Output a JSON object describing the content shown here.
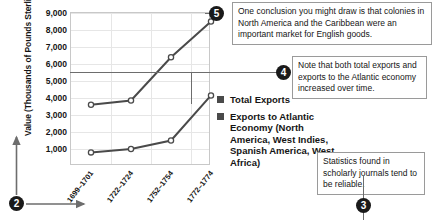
{
  "chart_data": {
    "type": "line",
    "title": "",
    "xlabel": "",
    "ylabel": "Value (Thousands of Pounds Sterling)",
    "categories": [
      "1699–1701",
      "1722–1724",
      "1752–1754",
      "1772–1774"
    ],
    "yticks": [
      "1,000",
      "2,000",
      "3,000",
      "4,000",
      "5,000",
      "6,000",
      "7,000",
      "8,000",
      "9,000"
    ],
    "ylim": [
      0,
      9000
    ],
    "ytick_values": [
      1000,
      2000,
      3000,
      4000,
      5000,
      6000,
      7000,
      8000,
      9000
    ],
    "grid": true,
    "legend_position": "right",
    "series": [
      {
        "name": "Total Exports",
        "color": "#4a4a4a",
        "values": [
          3600,
          3850,
          6400,
          8500
        ]
      },
      {
        "name": "Exports to Atlantic Economy (North America, West Indies, Spanish America, West Africa)",
        "color": "#4a4a4a",
        "values": [
          800,
          1000,
          1500,
          4150
        ]
      }
    ]
  },
  "legend": {
    "items": [
      {
        "label": "Total Exports",
        "swatch": "#4a4a4a"
      },
      {
        "label": "Exports to Atlantic Economy (North America, West Indies, Spanish America, West Africa)",
        "swatch": "#4a4a4a"
      }
    ]
  },
  "callouts": [
    {
      "number": "5",
      "text": "One conclusion you might draw is that colonies in North America and the Caribbean were an important market for English goods."
    },
    {
      "number": "4",
      "text": "Note that both total exports and exports to the Atlantic economy increased over time."
    },
    {
      "number": "3",
      "text": "Statistics found in scholarly journals tend to be reliable."
    }
  ],
  "markers": {
    "axis_marker": "2"
  },
  "colors": {
    "ink": "#151515",
    "series": "#4a4a4a",
    "grid": "#e6e6e6",
    "frame": "#c8c8c8",
    "badge": "#1a1a1a",
    "connector": "#6d6d6d"
  }
}
